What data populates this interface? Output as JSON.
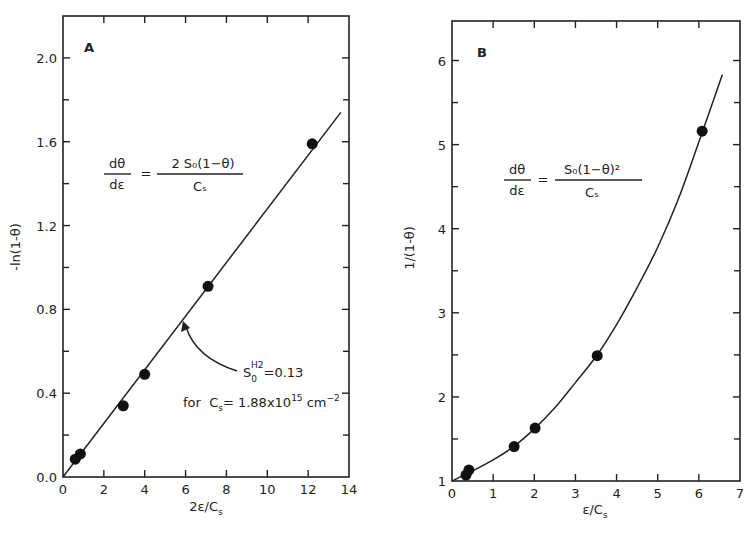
{
  "chart_data": [
    {
      "type": "scatter",
      "panel_label": "A",
      "xlabel": "2ε/C_s",
      "xlabel_main": "2ε/C",
      "xlabel_sub": "s",
      "ylabel": "-ln(1-θ)",
      "xlim": [
        0,
        14
      ],
      "ylim": [
        0,
        2.2
      ],
      "xticks": [
        0,
        2,
        4,
        6,
        8,
        10,
        12,
        14
      ],
      "xtick_labels": [
        "0",
        "2",
        "4",
        "6",
        "8",
        "10",
        "12",
        "14"
      ],
      "yticks_major": [
        0.0,
        0.4,
        0.8,
        1.2,
        1.6,
        2.0
      ],
      "ytick_labels": [
        "0.0",
        "0.4",
        "0.8",
        "1.2",
        "1.6",
        "2.0"
      ],
      "yticks_minor": [
        0.2,
        0.6,
        1.0,
        1.4,
        1.8
      ],
      "grid": false,
      "points": [
        {
          "x": 0.6,
          "y": 0.085
        },
        {
          "x": 0.85,
          "y": 0.11
        },
        {
          "x": 2.95,
          "y": 0.34
        },
        {
          "x": 4.0,
          "y": 0.49
        },
        {
          "x": 7.1,
          "y": 0.91
        },
        {
          "x": 12.2,
          "y": 1.59
        }
      ],
      "fit_line": [
        {
          "x": 0,
          "y": 0
        },
        {
          "x": 13.6,
          "y": 1.74
        }
      ],
      "equation": {
        "lhs_num": "dθ",
        "lhs_den": "dε",
        "equals": "=",
        "rhs_num": "2 S₀(1−θ)",
        "rhs_den": "Cₛ"
      },
      "annotation": {
        "line1_main": "S",
        "line1_sub": "0",
        "line1_sup": "H2",
        "line1_rest": "=0.13",
        "line2_prefix": "for  C",
        "line2_sub": "s",
        "line2_mid": "= 1.88x10",
        "line2_exp": "15",
        "line2_unit": " cm",
        "line2_unit_exp": "−2",
        "arrow_target": {
          "x": 6.0,
          "y": 0.74
        }
      }
    },
    {
      "type": "scatter",
      "panel_label": "B",
      "xlabel": "ε/C_s",
      "xlabel_main": "ε/C",
      "xlabel_sub": "s",
      "ylabel": "1/(1-θ)",
      "xlim": [
        0,
        7
      ],
      "ylim": [
        1,
        6.47
      ],
      "xticks": [
        0,
        1,
        2,
        3,
        4,
        5,
        6,
        7
      ],
      "xtick_labels": [
        "0",
        "1",
        "2",
        "3",
        "4",
        "5",
        "6",
        "7"
      ],
      "yticks_major": [
        1,
        2,
        3,
        4,
        5,
        6
      ],
      "ytick_labels": [
        "1",
        "2",
        "3",
        "4",
        "5",
        "6"
      ],
      "yticks_minor": [
        1.5,
        2.5,
        3.5,
        4.5,
        5.5
      ],
      "grid": false,
      "points": [
        {
          "x": 0.34,
          "y": 1.07
        },
        {
          "x": 0.41,
          "y": 1.13
        },
        {
          "x": 1.51,
          "y": 1.41
        },
        {
          "x": 2.02,
          "y": 1.63
        },
        {
          "x": 3.53,
          "y": 2.49
        },
        {
          "x": 6.08,
          "y": 5.16
        }
      ],
      "fit_curve": [
        {
          "x": 0,
          "y": 1.0
        },
        {
          "x": 0.5,
          "y": 1.12
        },
        {
          "x": 1.0,
          "y": 1.25
        },
        {
          "x": 1.5,
          "y": 1.41
        },
        {
          "x": 2.0,
          "y": 1.62
        },
        {
          "x": 2.5,
          "y": 1.87
        },
        {
          "x": 3.0,
          "y": 2.17
        },
        {
          "x": 3.5,
          "y": 2.48
        },
        {
          "x": 4.0,
          "y": 2.86
        },
        {
          "x": 4.5,
          "y": 3.3
        },
        {
          "x": 5.0,
          "y": 3.78
        },
        {
          "x": 5.5,
          "y": 4.35
        },
        {
          "x": 6.0,
          "y": 5.03
        },
        {
          "x": 6.57,
          "y": 5.83
        }
      ],
      "equation": {
        "lhs_num": "dθ",
        "lhs_den": "dε",
        "equals": "=",
        "rhs_num": "S₀(1−θ)²",
        "rhs_den": "Cₛ"
      }
    }
  ]
}
